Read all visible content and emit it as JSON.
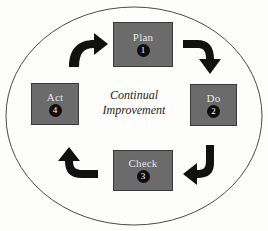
{
  "diagram": {
    "center_text": {
      "line1": "Continual",
      "line2": "Improvement"
    },
    "colors": {
      "background": "#fdfdfc",
      "box_fill": "#6b6b6b",
      "box_border": "#3a3a3a",
      "box_label": "#f2f2f0",
      "badge_fill": "#0d0d0d",
      "badge_text": "#ffffff",
      "ellipse_stroke": "#4a4a4a",
      "arrow_fill": "#111111"
    },
    "stages": [
      {
        "label": "Plan",
        "number": "1",
        "position": "top"
      },
      {
        "label": "Do",
        "number": "2",
        "position": "right"
      },
      {
        "label": "Check",
        "number": "3",
        "position": "bottom"
      },
      {
        "label": "Act",
        "number": "4",
        "position": "left"
      }
    ],
    "arrows": [
      {
        "name": "arrow-act-to-plan",
        "from": "Act",
        "to": "Plan",
        "direction": "up-right"
      },
      {
        "name": "arrow-plan-to-do",
        "from": "Plan",
        "to": "Do",
        "direction": "right-down"
      },
      {
        "name": "arrow-do-to-check",
        "from": "Do",
        "to": "Check",
        "direction": "down-left"
      },
      {
        "name": "arrow-check-to-act",
        "from": "Check",
        "to": "Act",
        "direction": "left-up"
      }
    ],
    "ellipse": {
      "cx": 134,
      "cy": 116,
      "rx": 129,
      "ry": 110
    }
  }
}
